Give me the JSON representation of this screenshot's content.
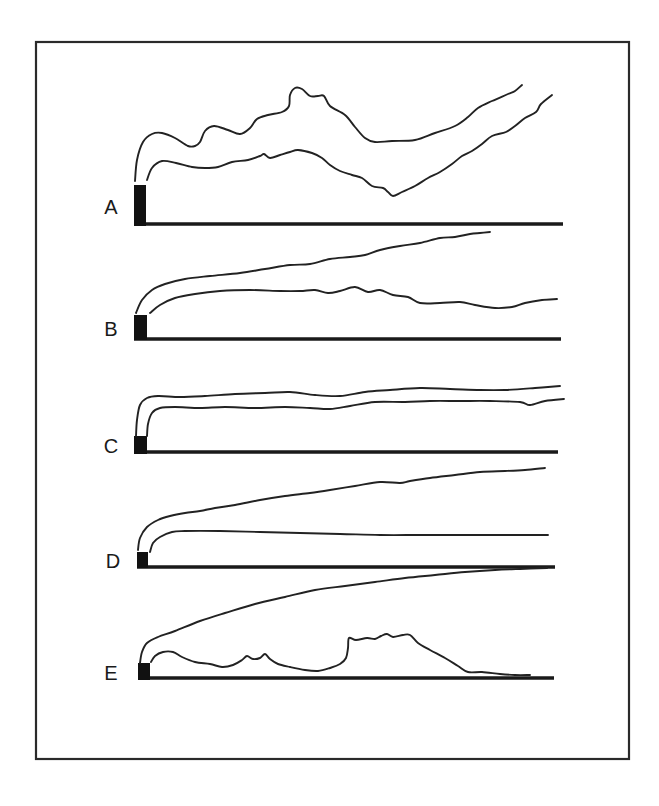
{
  "figure": {
    "frame": {
      "x": 36,
      "y": 42,
      "width": 593,
      "height": 717
    },
    "panels": [
      {
        "label": "A",
        "label_pos": [
          111,
          207
        ],
        "stack": {
          "x": 134,
          "y": 185,
          "width": 12,
          "height": 41
        },
        "ground": {
          "x1": 134,
          "x2": 563,
          "y": 224
        },
        "upper_plume": [
          [
            135,
            181
          ],
          [
            137,
            160
          ],
          [
            143,
            142
          ],
          [
            152,
            134
          ],
          [
            162,
            133
          ],
          [
            175,
            138
          ],
          [
            188,
            146
          ],
          [
            195,
            146
          ],
          [
            200,
            142
          ],
          [
            205,
            131
          ],
          [
            214,
            126
          ],
          [
            228,
            130
          ],
          [
            240,
            134
          ],
          [
            250,
            128
          ],
          [
            257,
            119
          ],
          [
            268,
            115
          ],
          [
            282,
            112
          ],
          [
            289,
            106
          ],
          [
            290,
            95
          ],
          [
            295,
            88
          ],
          [
            302,
            89
          ],
          [
            310,
            96
          ],
          [
            318,
            96
          ],
          [
            324,
            96
          ],
          [
            330,
            106
          ],
          [
            345,
            115
          ],
          [
            355,
            127
          ],
          [
            365,
            138
          ],
          [
            375,
            142
          ],
          [
            392,
            141
          ],
          [
            415,
            140
          ],
          [
            435,
            133
          ],
          [
            455,
            126
          ],
          [
            468,
            117
          ],
          [
            478,
            108
          ],
          [
            492,
            101
          ],
          [
            508,
            94
          ],
          [
            515,
            91
          ],
          [
            522,
            85
          ]
        ],
        "lower_plume": [
          [
            147,
            180
          ],
          [
            152,
            168
          ],
          [
            162,
            161
          ],
          [
            176,
            163
          ],
          [
            192,
            167
          ],
          [
            205,
            168
          ],
          [
            218,
            167
          ],
          [
            232,
            162
          ],
          [
            248,
            160
          ],
          [
            260,
            156
          ],
          [
            264,
            154
          ],
          [
            270,
            158
          ],
          [
            280,
            155
          ],
          [
            290,
            152
          ],
          [
            298,
            150
          ],
          [
            312,
            153
          ],
          [
            322,
            158
          ],
          [
            330,
            165
          ],
          [
            340,
            171
          ],
          [
            352,
            175
          ],
          [
            362,
            178
          ],
          [
            372,
            186
          ],
          [
            383,
            188
          ],
          [
            388,
            192
          ],
          [
            393,
            196
          ],
          [
            402,
            192
          ],
          [
            415,
            186
          ],
          [
            428,
            178
          ],
          [
            440,
            172
          ],
          [
            452,
            164
          ],
          [
            462,
            156
          ],
          [
            472,
            151
          ],
          [
            482,
            144
          ],
          [
            492,
            136
          ],
          [
            506,
            132
          ],
          [
            515,
            126
          ],
          [
            525,
            118
          ],
          [
            536,
            112
          ],
          [
            541,
            104
          ],
          [
            552,
            95
          ]
        ]
      },
      {
        "label": "B",
        "label_pos": [
          111,
          329
        ],
        "stack": {
          "x": 134,
          "y": 315,
          "width": 13,
          "height": 25
        },
        "ground": {
          "x1": 134,
          "x2": 561,
          "y": 339
        },
        "upper_plume": [
          [
            136,
            313
          ],
          [
            142,
            300
          ],
          [
            152,
            290
          ],
          [
            165,
            284
          ],
          [
            185,
            279
          ],
          [
            210,
            276
          ],
          [
            240,
            273
          ],
          [
            265,
            269
          ],
          [
            290,
            265
          ],
          [
            310,
            264
          ],
          [
            330,
            259
          ],
          [
            350,
            257
          ],
          [
            365,
            255
          ],
          [
            380,
            250
          ],
          [
            400,
            246
          ],
          [
            420,
            243
          ],
          [
            440,
            238
          ],
          [
            455,
            237
          ],
          [
            470,
            234
          ],
          [
            480,
            233
          ],
          [
            490,
            232
          ]
        ],
        "lower_plume": [
          [
            150,
            313
          ],
          [
            160,
            305
          ],
          [
            175,
            298
          ],
          [
            195,
            294
          ],
          [
            220,
            291
          ],
          [
            250,
            290
          ],
          [
            280,
            291
          ],
          [
            300,
            291
          ],
          [
            315,
            290
          ],
          [
            328,
            293
          ],
          [
            340,
            291
          ],
          [
            355,
            287
          ],
          [
            368,
            292
          ],
          [
            380,
            290
          ],
          [
            393,
            295
          ],
          [
            408,
            297
          ],
          [
            420,
            303
          ],
          [
            440,
            303
          ],
          [
            460,
            302
          ],
          [
            475,
            305
          ],
          [
            495,
            308
          ],
          [
            512,
            307
          ],
          [
            525,
            303
          ],
          [
            542,
            300
          ],
          [
            557,
            299
          ]
        ]
      },
      {
        "label": "C",
        "label_pos": [
          111,
          446
        ],
        "stack": {
          "x": 134,
          "y": 436,
          "width": 13,
          "height": 18
        },
        "ground": {
          "x1": 134,
          "x2": 558,
          "y": 452
        },
        "upper_plume": [
          [
            136,
            436
          ],
          [
            137,
            420
          ],
          [
            140,
            405
          ],
          [
            147,
            398
          ],
          [
            158,
            396
          ],
          [
            180,
            397
          ],
          [
            205,
            396
          ],
          [
            235,
            394
          ],
          [
            265,
            393
          ],
          [
            290,
            392
          ],
          [
            315,
            395
          ],
          [
            340,
            396
          ],
          [
            365,
            392
          ],
          [
            390,
            390
          ],
          [
            420,
            388
          ],
          [
            450,
            389
          ],
          [
            480,
            390
          ],
          [
            505,
            390
          ],
          [
            535,
            388
          ],
          [
            560,
            386
          ]
        ],
        "lower_plume": [
          [
            147,
            436
          ],
          [
            148,
            424
          ],
          [
            152,
            413
          ],
          [
            160,
            408
          ],
          [
            175,
            407
          ],
          [
            200,
            408
          ],
          [
            225,
            407
          ],
          [
            255,
            408
          ],
          [
            285,
            407
          ],
          [
            310,
            408
          ],
          [
            330,
            409
          ],
          [
            350,
            406
          ],
          [
            375,
            402
          ],
          [
            405,
            402
          ],
          [
            430,
            401
          ],
          [
            460,
            401
          ],
          [
            490,
            401
          ],
          [
            520,
            402
          ],
          [
            530,
            405
          ],
          [
            545,
            401
          ],
          [
            564,
            399
          ]
        ]
      },
      {
        "label": "D",
        "label_pos": [
          113,
          561
        ],
        "stack": {
          "x": 137,
          "y": 552,
          "width": 11,
          "height": 16
        },
        "ground": {
          "x1": 137,
          "x2": 555,
          "y": 567
        },
        "upper_plume": [
          [
            138,
            550
          ],
          [
            140,
            538
          ],
          [
            147,
            527
          ],
          [
            158,
            520
          ],
          [
            170,
            516
          ],
          [
            185,
            513
          ],
          [
            200,
            511
          ],
          [
            215,
            508
          ],
          [
            235,
            505
          ],
          [
            260,
            500
          ],
          [
            285,
            496
          ],
          [
            310,
            493
          ],
          [
            330,
            490
          ],
          [
            355,
            486
          ],
          [
            380,
            482
          ],
          [
            400,
            483
          ],
          [
            410,
            481
          ],
          [
            430,
            478
          ],
          [
            455,
            475
          ],
          [
            480,
            472
          ],
          [
            505,
            471
          ],
          [
            525,
            470
          ],
          [
            545,
            468
          ]
        ],
        "lower_plume": [
          [
            150,
            552
          ],
          [
            153,
            543
          ],
          [
            160,
            537
          ],
          [
            172,
            532
          ],
          [
            185,
            531
          ],
          [
            220,
            531
          ],
          [
            260,
            532
          ],
          [
            300,
            533
          ],
          [
            340,
            534
          ],
          [
            380,
            535
          ],
          [
            420,
            535
          ],
          [
            460,
            535
          ],
          [
            500,
            535
          ],
          [
            530,
            535
          ],
          [
            548,
            535
          ]
        ]
      },
      {
        "label": "E",
        "label_pos": [
          111,
          673
        ],
        "stack": {
          "x": 138,
          "y": 663,
          "width": 12,
          "height": 17
        },
        "ground": {
          "x1": 138,
          "x2": 554,
          "y": 678
        },
        "upper_plume": [
          [
            140,
            663
          ],
          [
            142,
            652
          ],
          [
            147,
            643
          ],
          [
            158,
            637
          ],
          [
            175,
            631
          ],
          [
            200,
            621
          ],
          [
            225,
            613
          ],
          [
            255,
            604
          ],
          [
            285,
            597
          ],
          [
            315,
            590
          ],
          [
            345,
            586
          ],
          [
            375,
            582
          ],
          [
            405,
            578
          ],
          [
            435,
            575
          ],
          [
            465,
            572
          ],
          [
            495,
            570
          ],
          [
            520,
            569
          ],
          [
            547,
            568
          ]
        ],
        "lower_plume": [
          [
            151,
            662
          ],
          [
            155,
            656
          ],
          [
            163,
            652
          ],
          [
            173,
            652
          ],
          [
            182,
            657
          ],
          [
            195,
            662
          ],
          [
            210,
            664
          ],
          [
            222,
            667
          ],
          [
            233,
            665
          ],
          [
            242,
            660
          ],
          [
            247,
            656
          ],
          [
            253,
            659
          ],
          [
            260,
            658
          ],
          [
            265,
            654
          ],
          [
            270,
            659
          ],
          [
            278,
            664
          ],
          [
            290,
            667
          ],
          [
            305,
            670
          ],
          [
            318,
            671
          ],
          [
            330,
            668
          ],
          [
            340,
            664
          ],
          [
            346,
            658
          ],
          [
            348,
            648
          ],
          [
            349,
            638
          ],
          [
            356,
            640
          ],
          [
            367,
            638
          ],
          [
            375,
            639
          ],
          [
            381,
            636
          ],
          [
            387,
            634
          ],
          [
            393,
            637
          ],
          [
            403,
            635
          ],
          [
            410,
            635
          ],
          [
            418,
            643
          ],
          [
            430,
            650
          ],
          [
            445,
            658
          ],
          [
            458,
            666
          ],
          [
            468,
            672
          ],
          [
            482,
            672
          ],
          [
            500,
            674
          ],
          [
            515,
            675
          ],
          [
            530,
            675
          ]
        ]
      }
    ]
  }
}
